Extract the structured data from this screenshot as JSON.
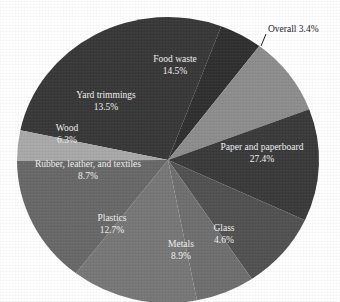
{
  "chart_data": {
    "type": "pie",
    "title": "",
    "subtitle": "",
    "xlabel": "",
    "ylabel": "",
    "legend_position": "none",
    "grid": false,
    "labels_inside": true,
    "units": "percent",
    "total": 100.0,
    "categories": [
      "Paper and paperboard",
      "Glass",
      "Metals",
      "Plastics",
      "Rubber, leather, and textiles",
      "Wood",
      "Yard trimmings",
      "Food waste",
      "Overall"
    ],
    "values": [
      27.4,
      4.6,
      8.9,
      12.7,
      8.7,
      6.3,
      13.5,
      14.5,
      3.4
    ],
    "slices": [
      {
        "label": "Paper and paperboard",
        "value": 27.4,
        "value_text": "27.4%",
        "color": "#383838",
        "label_placement": "inside",
        "label_color": "#f0f0f0"
      },
      {
        "label": "Glass",
        "value": 4.6,
        "value_text": "4.6%",
        "color": "#2f2f2f",
        "label_placement": "inside",
        "label_color": "#f0f0f0"
      },
      {
        "label": "Metals",
        "value": 8.9,
        "value_text": "8.9%",
        "color": "#8d8d8d",
        "label_placement": "inside",
        "label_color": "#fbfbfb"
      },
      {
        "label": "Plastics",
        "value": 12.7,
        "value_text": "12.7%",
        "color": "#3a3a3a",
        "label_placement": "inside",
        "label_color": "#f0f0f0"
      },
      {
        "label": "Rubber, leather, and textiles",
        "value": 8.7,
        "value_text": "8.7%",
        "color": "#515151",
        "label_placement": "inside",
        "label_color": "#f2f2f2"
      },
      {
        "label": "Wood",
        "value": 6.3,
        "value_text": "6.3%",
        "color": "#6f6f6f",
        "label_placement": "inside",
        "label_color": "#fafafa"
      },
      {
        "label": "Yard trimmings",
        "value": 13.5,
        "value_text": "13.5%",
        "color": "#777777",
        "label_placement": "inside",
        "label_color": "#fbfbfb"
      },
      {
        "label": "Food waste",
        "value": 14.5,
        "value_text": "14.5%",
        "color": "#686868",
        "label_placement": "inside",
        "label_color": "#fafafa"
      },
      {
        "label": "Overall",
        "value": 3.4,
        "value_text": "3.4%",
        "color": "#a9a9a9",
        "label_placement": "outside",
        "label_color": "#1b1b1b",
        "callout_text": "Overall 3.4%",
        "has_leader_line": true
      }
    ],
    "colors": {
      "background": "#ffffff",
      "outside_label_text": "#1b1b1b",
      "inside_label_text": "#f5f5f5",
      "leader_line": "#1b1b1b"
    }
  },
  "labels": {
    "paper": {
      "name": "Paper and paperboard",
      "pct": "27.4%"
    },
    "glass": {
      "name": "Glass",
      "pct": "4.6%"
    },
    "metals": {
      "name": "Metals",
      "pct": "8.9%"
    },
    "plastics": {
      "name": "Plastics",
      "pct": "12.7%"
    },
    "rubber": {
      "name": "Rubber, leather, and textiles",
      "pct": "8.7%"
    },
    "wood": {
      "name": "Wood",
      "pct": "6.3%"
    },
    "yard": {
      "name": "Yard trimmings",
      "pct": "13.5%"
    },
    "food": {
      "name": "Food waste",
      "pct": "14.5%"
    },
    "overall": {
      "callout": "Overall 3.4%"
    }
  }
}
